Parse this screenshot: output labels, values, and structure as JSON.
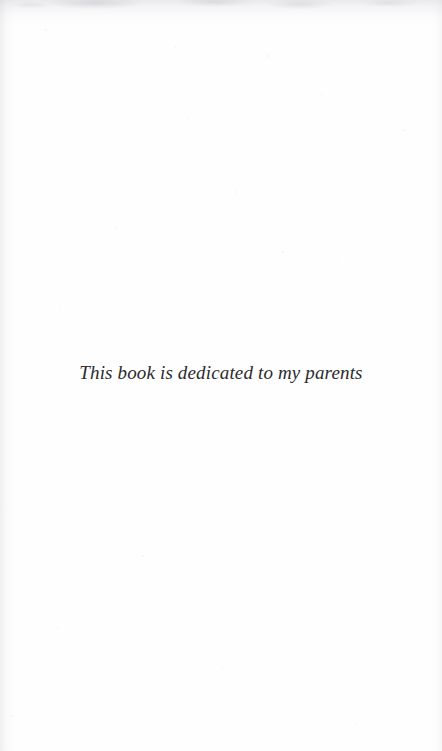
{
  "document": {
    "type": "book-dedication-page",
    "page_width": 442,
    "page_height": 751,
    "paper_color": "#fefeff",
    "ink_color": "#2b2b2b"
  },
  "dedication": {
    "text": "This book is dedicated to my parents",
    "style": "italic-serif",
    "alignment": "center"
  },
  "scan_artifacts": {
    "top_edge_shadow": true,
    "left_edge_shadow": true,
    "right_edge_shadow": true,
    "speckles": true
  }
}
